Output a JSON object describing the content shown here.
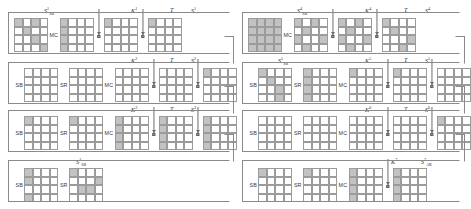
{
  "figure": {
    "colors": {
      "active_cell": "#c2c2c2",
      "grid_line": "#9b9b9b",
      "wire": "#8a8a8a",
      "text": "#2b2b2b"
    }
  },
  "ops": {
    "sb": "SB",
    "sr": "SR",
    "mc": "MC"
  },
  "left_panel": {
    "rounds": [
      {
        "id": "round-1",
        "head_label": {
          "base": "S",
          "sub": "SB",
          "sup": "1"
        },
        "key_label": {
          "base": "K",
          "sup": "1"
        },
        "t_label": "T",
        "out_label": {
          "base": "S",
          "sup": "1"
        },
        "grids": [
          {
            "name": "state-sb",
            "cells": [
              1,
              0,
              1,
              0,
              0,
              1,
              0,
              0,
              0,
              0,
              1,
              0,
              0,
              0,
              0,
              1
            ]
          },
          {
            "name": "state-sr",
            "cells": [
              1,
              0,
              0,
              0,
              1,
              0,
              0,
              0,
              1,
              0,
              0,
              0,
              1,
              0,
              0,
              0
            ]
          },
          {
            "name": "state-mc",
            "cells": [
              1,
              0,
              0,
              0,
              0,
              0,
              0,
              0,
              0,
              0,
              0,
              0,
              0,
              0,
              0,
              0
            ]
          },
          {
            "name": "state-key-xor",
            "cells": [
              1,
              0,
              0,
              0,
              0,
              0,
              0,
              0,
              0,
              0,
              0,
              0,
              0,
              0,
              0,
              0
            ]
          },
          {
            "name": "state-out",
            "cells": [
              0,
              0,
              0,
              0,
              0,
              0,
              0,
              0,
              0,
              0,
              0,
              0,
              0,
              0,
              0,
              0
            ]
          }
        ]
      },
      {
        "id": "round-2",
        "head_label": null,
        "key_label": {
          "base": "K",
          "sup": "2"
        },
        "t_label": "T",
        "out_label": {
          "base": "S",
          "sup": "2"
        },
        "grids": [
          {
            "name": "state-sb",
            "cells": [
              0,
              0,
              0,
              0,
              0,
              0,
              0,
              0,
              0,
              0,
              0,
              0,
              0,
              0,
              0,
              0
            ]
          },
          {
            "name": "state-sr",
            "cells": [
              0,
              0,
              0,
              0,
              0,
              0,
              0,
              0,
              0,
              0,
              0,
              0,
              0,
              0,
              0,
              0
            ]
          },
          {
            "name": "state-mc",
            "cells": [
              0,
              0,
              0,
              0,
              0,
              0,
              0,
              0,
              0,
              0,
              0,
              0,
              0,
              0,
              0,
              0
            ]
          },
          {
            "name": "state-key-xor",
            "cells": [
              0,
              0,
              0,
              0,
              0,
              0,
              0,
              0,
              0,
              0,
              0,
              0,
              0,
              0,
              0,
              0
            ]
          },
          {
            "name": "state-out",
            "cells": [
              1,
              0,
              0,
              0,
              0,
              0,
              0,
              0,
              0,
              0,
              0,
              0,
              0,
              0,
              0,
              0
            ]
          }
        ]
      },
      {
        "id": "round-3",
        "head_label": null,
        "key_label": {
          "base": "K",
          "sup": "3"
        },
        "t_label": "T",
        "out_label": {
          "base": "S",
          "sup": "3"
        },
        "grids": [
          {
            "name": "state-sb",
            "cells": [
              1,
              0,
              0,
              0,
              0,
              0,
              0,
              0,
              0,
              0,
              0,
              0,
              0,
              0,
              0,
              0
            ]
          },
          {
            "name": "state-sr",
            "cells": [
              1,
              0,
              0,
              0,
              0,
              0,
              0,
              0,
              0,
              0,
              0,
              0,
              0,
              0,
              0,
              0
            ]
          },
          {
            "name": "state-mc",
            "cells": [
              1,
              0,
              0,
              0,
              1,
              0,
              0,
              0,
              1,
              0,
              0,
              0,
              1,
              0,
              0,
              0
            ]
          },
          {
            "name": "state-key-xor",
            "cells": [
              1,
              0,
              0,
              0,
              1,
              0,
              0,
              0,
              1,
              0,
              0,
              0,
              1,
              0,
              0,
              0
            ]
          },
          {
            "name": "state-out",
            "cells": [
              1,
              0,
              0,
              0,
              1,
              0,
              0,
              0,
              1,
              0,
              0,
              0,
              1,
              0,
              0,
              0
            ]
          }
        ]
      },
      {
        "id": "round-4",
        "head_label": {
          "base": "S",
          "sub": "SB",
          "sup": "4"
        },
        "key_label": null,
        "t_label": null,
        "out_label": null,
        "grids": [
          {
            "name": "state-sb",
            "cells": [
              1,
              0,
              0,
              0,
              1,
              0,
              0,
              0,
              0,
              0,
              0,
              0,
              1,
              0,
              0,
              0
            ]
          },
          {
            "name": "state-sr",
            "cells": [
              1,
              0,
              0,
              0,
              0,
              0,
              0,
              1,
              0,
              1,
              1,
              0,
              0,
              0,
              0,
              0
            ]
          }
        ]
      }
    ]
  },
  "right_panel": {
    "rounds": [
      {
        "id": "round-4b",
        "head_label": {
          "base": "S",
          "sub": "SB",
          "sup": "4"
        },
        "key_label": {
          "base": "K",
          "sup": "4"
        },
        "t_label": "T",
        "out_label": {
          "base": "S",
          "sup": "4"
        },
        "grids": [
          {
            "name": "state-sb",
            "cells": [
              1,
              1,
              1,
              1,
              1,
              1,
              1,
              1,
              1,
              1,
              1,
              1,
              1,
              1,
              1,
              1
            ]
          },
          {
            "name": "state-mc",
            "cells": [
              1,
              0,
              1,
              0,
              0,
              1,
              0,
              0,
              1,
              0,
              0,
              1,
              0,
              1,
              0,
              0
            ]
          },
          {
            "name": "state-key-xor",
            "cells": [
              1,
              0,
              1,
              0,
              0,
              1,
              0,
              0,
              1,
              0,
              0,
              1,
              0,
              1,
              0,
              0
            ]
          },
          {
            "name": "state-out",
            "cells": [
              1,
              0,
              0,
              0,
              0,
              1,
              0,
              0,
              0,
              0,
              0,
              1,
              0,
              0,
              1,
              0
            ]
          }
        ]
      },
      {
        "id": "round-5",
        "head_label": {
          "base": "S",
          "sub": "SB",
          "sup": "5"
        },
        "key_label": {
          "base": "K",
          "sup": "5"
        },
        "t_label": "T",
        "out_label": {
          "base": "S",
          "sup": "5"
        },
        "grids": [
          {
            "name": "state-sb",
            "cells": [
              1,
              0,
              0,
              0,
              0,
              1,
              0,
              0,
              0,
              0,
              1,
              0,
              0,
              0,
              1,
              0
            ]
          },
          {
            "name": "state-sr",
            "cells": [
              1,
              0,
              0,
              0,
              1,
              0,
              0,
              0,
              1,
              0,
              0,
              0,
              1,
              0,
              0,
              0
            ]
          },
          {
            "name": "state-mc",
            "cells": [
              1,
              0,
              0,
              0,
              0,
              0,
              0,
              0,
              0,
              0,
              0,
              0,
              0,
              0,
              0,
              0
            ]
          },
          {
            "name": "state-key-xor",
            "cells": [
              1,
              0,
              0,
              0,
              0,
              0,
              0,
              0,
              0,
              0,
              0,
              0,
              0,
              0,
              0,
              0
            ]
          },
          {
            "name": "state-out",
            "cells": [
              0,
              0,
              0,
              0,
              0,
              0,
              0,
              0,
              0,
              0,
              0,
              0,
              0,
              0,
              0,
              0
            ]
          }
        ]
      },
      {
        "id": "round-6",
        "head_label": null,
        "key_label": {
          "base": "K",
          "sup": "6"
        },
        "t_label": "T",
        "out_label": {
          "base": "S",
          "sup": "6"
        },
        "grids": [
          {
            "name": "state-sb",
            "cells": [
              0,
              0,
              0,
              0,
              0,
              0,
              0,
              0,
              0,
              0,
              0,
              0,
              0,
              0,
              0,
              0
            ]
          },
          {
            "name": "state-sr",
            "cells": [
              0,
              0,
              0,
              0,
              0,
              0,
              0,
              0,
              0,
              0,
              0,
              0,
              0,
              0,
              0,
              0
            ]
          },
          {
            "name": "state-mc",
            "cells": [
              0,
              0,
              0,
              0,
              0,
              0,
              0,
              0,
              0,
              0,
              0,
              0,
              0,
              0,
              0,
              0
            ]
          },
          {
            "name": "state-key-xor",
            "cells": [
              0,
              0,
              0,
              0,
              0,
              0,
              0,
              0,
              0,
              0,
              0,
              0,
              0,
              0,
              0,
              0
            ]
          },
          {
            "name": "state-out",
            "cells": [
              1,
              0,
              0,
              0,
              0,
              0,
              0,
              0,
              0,
              0,
              0,
              0,
              0,
              0,
              0,
              0
            ]
          }
        ]
      },
      {
        "id": "round-7",
        "head_label": null,
        "key_label": {
          "base": "K",
          "sup": "7"
        },
        "t_label": null,
        "out_label": {
          "base": "S",
          "sub": "AK",
          "sup": "7"
        },
        "grids": [
          {
            "name": "state-sb",
            "cells": [
              1,
              0,
              0,
              0,
              0,
              0,
              0,
              0,
              0,
              0,
              0,
              0,
              0,
              0,
              0,
              0
            ]
          },
          {
            "name": "state-sr",
            "cells": [
              1,
              0,
              0,
              0,
              0,
              0,
              0,
              0,
              0,
              0,
              0,
              0,
              0,
              0,
              0,
              0
            ]
          },
          {
            "name": "state-mc",
            "cells": [
              1,
              0,
              0,
              0,
              1,
              0,
              0,
              0,
              1,
              0,
              0,
              0,
              1,
              0,
              0,
              0
            ]
          },
          {
            "name": "state-key-xor",
            "cells": [
              1,
              0,
              0,
              0,
              1,
              0,
              0,
              0,
              1,
              0,
              0,
              0,
              1,
              0,
              0,
              0
            ]
          }
        ]
      }
    ]
  }
}
